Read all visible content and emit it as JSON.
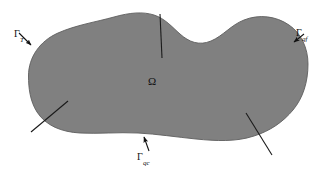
{
  "figure": {
    "type": "domain-boundary-diagram",
    "background_color": "#ffffff",
    "domain_fill_color": "#808080",
    "domain_stroke_color": "#5a5a5a",
    "line_color": "#1a1a1a"
  },
  "labels": {
    "domain": {
      "symbol": "Ω",
      "name": "omega"
    },
    "boundary_t": {
      "symbol": "Γ",
      "subscript": "T",
      "name": "gamma-T"
    },
    "boundary_qf": {
      "symbol": "Γ",
      "subscript": "qf",
      "name": "gamma-qf"
    },
    "boundary_qc": {
      "symbol": "Γ",
      "subscript": "qc",
      "name": "gamma-qc"
    }
  },
  "leader_lines": [
    {
      "name": "leader-top",
      "x1": 160,
      "y1": 14,
      "x2": 162,
      "y2": 58
    },
    {
      "name": "leader-bottom-left",
      "x1": 31,
      "y1": 132,
      "x2": 68,
      "y2": 101
    },
    {
      "name": "leader-bottom-right",
      "x1": 272,
      "y1": 155,
      "x2": 246,
      "y2": 113
    }
  ],
  "arrows": [
    {
      "name": "arrow-gamma-T",
      "x1": 19,
      "y1": 34,
      "x2": 32,
      "y2": 46
    },
    {
      "name": "arrow-gamma-qf",
      "x1": 303,
      "y1": 34,
      "x2": 292,
      "y2": 43
    },
    {
      "name": "arrow-gamma-qc",
      "x1": 148,
      "y1": 152,
      "x2": 143,
      "y2": 138
    }
  ]
}
